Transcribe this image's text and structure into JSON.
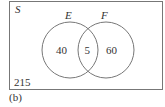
{
  "diagram": {
    "type": "venn",
    "universe_label": "S",
    "sets": [
      {
        "label": "E",
        "only_count": "40"
      },
      {
        "label": "F",
        "only_count": "60"
      }
    ],
    "intersection_count": "5",
    "outside_count": "215",
    "caption": "(b)"
  }
}
